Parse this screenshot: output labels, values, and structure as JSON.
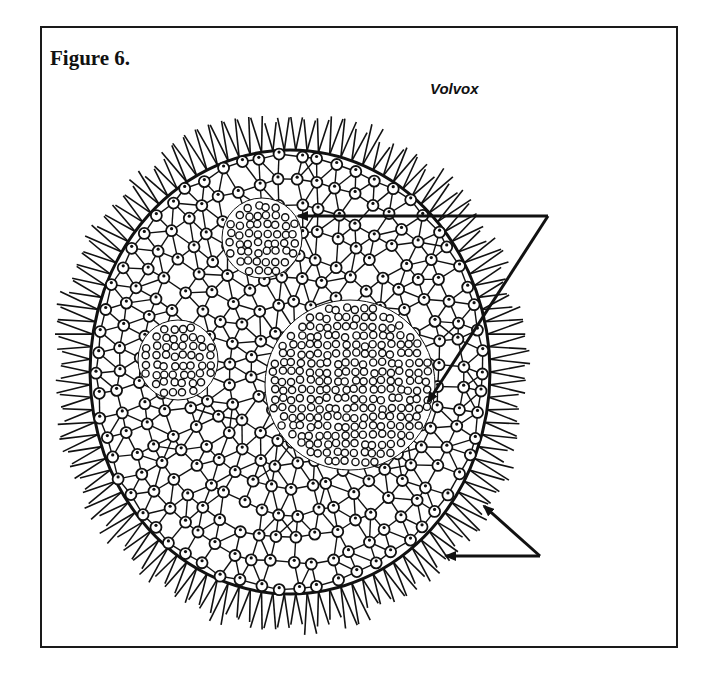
{
  "figure": {
    "title": "Figure 6.",
    "subject_label": "Volvox"
  },
  "diagram": {
    "organism": "Volvox colony",
    "parts": [
      {
        "name": "daughter-colony-upper",
        "cx": 262,
        "cy": 238,
        "r": 40
      },
      {
        "name": "daughter-colony-left",
        "cx": 178,
        "cy": 360,
        "r": 40
      },
      {
        "name": "daughter-colony-large",
        "cx": 350,
        "cy": 385,
        "r": 85
      }
    ],
    "arrows": [
      {
        "name": "arrow-to-upper-daughter-colony",
        "from": [
          548,
          216
        ],
        "to": [
          296,
          216
        ]
      },
      {
        "name": "arrow-to-large-daughter-colony",
        "from": [
          548,
          216
        ],
        "to": [
          428,
          402
        ]
      },
      {
        "name": "arrow-to-flagella-upper",
        "from": [
          540,
          556
        ],
        "to": [
          484,
          506
        ]
      },
      {
        "name": "arrow-to-flagella-lower",
        "from": [
          540,
          556
        ],
        "to": [
          444,
          556
        ]
      }
    ],
    "colors": {
      "ink": "#111111",
      "background": "#ffffff"
    }
  }
}
